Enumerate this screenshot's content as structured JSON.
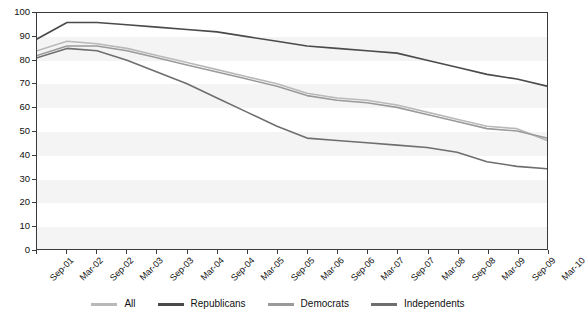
{
  "chart_data": {
    "type": "line",
    "title": "",
    "subtitle": "",
    "xlabel": "",
    "ylabel": "",
    "ylim": [
      0,
      100
    ],
    "yticks": [
      0,
      10,
      20,
      30,
      40,
      50,
      60,
      70,
      80,
      90,
      100
    ],
    "grid": false,
    "legend_position": "bottom",
    "x": [
      "Sep-01",
      "Mar-02",
      "Sep-02",
      "Mar-03",
      "Sep-03",
      "Mar-04",
      "Sep-04",
      "Mar-05",
      "Sep-05",
      "Mar-06",
      "Sep-06",
      "Mar-07",
      "Sep-07",
      "Mar-08",
      "Sep-08",
      "Mar-09",
      "Sep-09",
      "Mar-10"
    ],
    "xtick_labels": [
      "Sep-01",
      "Mar-02",
      "Sep-02",
      "Mar-03",
      "Sep-03",
      "Mar-04",
      "Sep-04",
      "Mar-05",
      "Sep-05",
      "Mar-06",
      "Sep-06",
      "Mar-07",
      "Sep-07",
      "Mar-08",
      "Sep-08",
      "Mar-09",
      "Sep-09",
      "Mar-10"
    ],
    "series": [
      {
        "name": "All",
        "color": "#b9b9b9",
        "values": [
          84,
          88,
          87,
          85,
          82,
          79,
          76,
          73,
          70,
          66,
          64,
          63,
          61,
          58,
          55,
          52,
          51,
          46
        ]
      },
      {
        "name": "Republicans",
        "color": "#4a4a4a",
        "values": [
          89,
          96,
          96,
          95,
          94,
          93,
          92,
          90,
          88,
          86,
          85,
          84,
          83,
          80,
          77,
          74,
          72,
          69
        ]
      },
      {
        "name": "Democrats",
        "color": "#9a9a9a",
        "values": [
          82,
          86,
          86,
          84,
          81,
          78,
          75,
          72,
          69,
          65,
          63,
          62,
          60,
          57,
          54,
          51,
          50,
          47
        ]
      },
      {
        "name": "Independents",
        "color": "#6e6e6e",
        "values": [
          81,
          85,
          84,
          80,
          75,
          70,
          64,
          58,
          52,
          47,
          46,
          45,
          44,
          43,
          41,
          37,
          35,
          34
        ]
      }
    ]
  },
  "legend": {
    "items": [
      {
        "label": "All",
        "color": "#b9b9b9"
      },
      {
        "label": "Republicans",
        "color": "#4a4a4a"
      },
      {
        "label": "Democrats",
        "color": "#9a9a9a"
      },
      {
        "label": "Independents",
        "color": "#6e6e6e"
      }
    ]
  },
  "axis": {
    "y_labels": [
      "100",
      "90",
      "80",
      "70",
      "60",
      "50",
      "40",
      "30",
      "20",
      "10",
      "0"
    ],
    "x_labels": [
      "Sep-01",
      "Mar-02",
      "Sep-02",
      "Mar-03",
      "Sep-03",
      "Mar-04",
      "Sep-04",
      "Mar-05",
      "Sep-05",
      "Mar-06",
      "Sep-06",
      "Mar-07",
      "Sep-07",
      "Mar-08",
      "Sep-08",
      "Mar-09",
      "Sep-09",
      "Mar-10"
    ]
  }
}
